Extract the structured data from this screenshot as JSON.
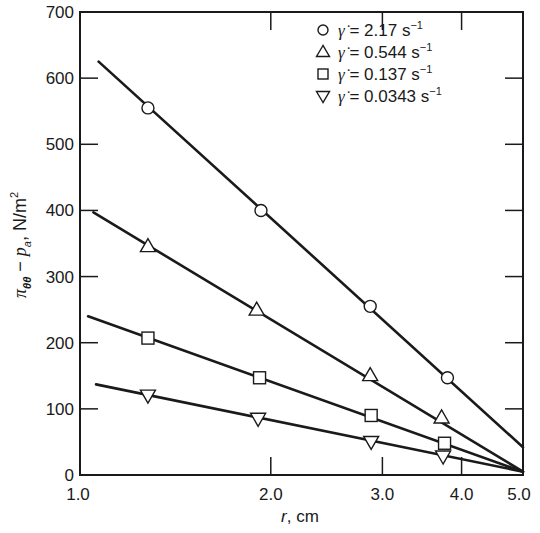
{
  "chart_data": {
    "type": "line",
    "title": "",
    "xlabel": "r, cm",
    "ylabel": "π_θθ − p_a, N/m²",
    "xscale": "log",
    "xlim": [
      1.0,
      5.0
    ],
    "ylim": [
      0,
      700
    ],
    "x_ticks": [
      1.0,
      2.0,
      3.0,
      4.0,
      5.0
    ],
    "x_tick_labels": [
      "1.0",
      "2.0",
      "3.0",
      "4.0",
      "5.0"
    ],
    "y_ticks": [
      0,
      100,
      200,
      300,
      400,
      500,
      600,
      700
    ],
    "y_tick_labels": [
      "0",
      "100",
      "200",
      "300",
      "400",
      "500",
      "600",
      "700"
    ],
    "grid": false,
    "legend_position": "upper right",
    "series": [
      {
        "name": "γ̇ = 2.17 s⁻¹",
        "rate": "2.17",
        "marker": "circle",
        "points": [
          [
            1.28,
            555
          ],
          [
            1.93,
            400
          ],
          [
            2.87,
            255
          ],
          [
            3.8,
            147
          ]
        ],
        "fit_line": [
          [
            1.07,
            625
          ],
          [
            5.0,
            42
          ]
        ]
      },
      {
        "name": "γ̇ = 0.544 s⁻¹",
        "rate": "0.544",
        "marker": "triangle-up",
        "points": [
          [
            1.28,
            346
          ],
          [
            1.9,
            250
          ],
          [
            2.87,
            151
          ],
          [
            3.72,
            87
          ]
        ],
        "fit_line": [
          [
            1.05,
            397
          ],
          [
            5.0,
            5
          ]
        ]
      },
      {
        "name": "γ̇ = 0.137 s⁻¹",
        "rate": "0.137",
        "marker": "square",
        "points": [
          [
            1.28,
            207
          ],
          [
            1.92,
            147
          ],
          [
            2.88,
            90
          ],
          [
            3.76,
            48
          ]
        ],
        "fit_line": [
          [
            1.03,
            240
          ],
          [
            5.0,
            5
          ]
        ]
      },
      {
        "name": "γ̇ = 0.0343 s⁻¹",
        "rate": "0.0343",
        "marker": "triangle-down",
        "points": [
          [
            1.28,
            120
          ],
          [
            1.91,
            85
          ],
          [
            2.88,
            50
          ],
          [
            3.74,
            28
          ]
        ],
        "fit_line": [
          [
            1.06,
            137
          ],
          [
            5.0,
            5
          ]
        ]
      }
    ]
  },
  "legend": {
    "items": [
      {
        "symbol": "γ̇",
        "equals": "=",
        "value": "2.17",
        "unit": "s",
        "exp": "−1"
      },
      {
        "symbol": "γ̇",
        "equals": "=",
        "value": "0.544",
        "unit": "s",
        "exp": "−1"
      },
      {
        "symbol": "γ̇",
        "equals": "=",
        "value": "0.137",
        "unit": "s",
        "exp": "−1"
      },
      {
        "symbol": "γ̇",
        "equals": "=",
        "value": "0.0343",
        "unit": "s",
        "exp": "−1"
      }
    ]
  },
  "axes": {
    "x_label_var": "r",
    "x_label_unit": ", cm",
    "y_label_pi": "π",
    "y_label_sub": "θθ",
    "y_label_minus": " − ",
    "y_label_p": "p",
    "y_label_psub": "a",
    "y_label_unit": ",  N/m",
    "y_label_exp": "2"
  }
}
